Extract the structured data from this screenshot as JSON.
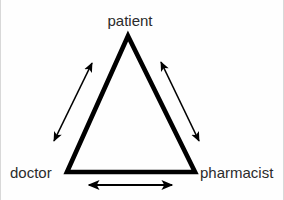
{
  "diagram": {
    "type": "triangle-relationship",
    "title": "",
    "background_color": "#fefefe",
    "stroke_color": "#000000",
    "label_color": "#2b2b2b",
    "nodes": [
      {
        "id": "patient",
        "label": "patient",
        "position": "apex",
        "x": 128,
        "y": 36
      },
      {
        "id": "doctor",
        "label": "doctor",
        "position": "bottom-left",
        "x": 67,
        "y": 172
      },
      {
        "id": "pharmacist",
        "label": "pharmacist",
        "position": "bottom-right",
        "x": 195,
        "y": 172
      }
    ],
    "edges": [
      {
        "id": "doctor-patient",
        "from": "doctor",
        "to": "patient",
        "bidirectional": true,
        "side": "left"
      },
      {
        "id": "patient-pharmacist",
        "from": "patient",
        "to": "pharmacist",
        "bidirectional": true,
        "side": "right"
      },
      {
        "id": "doctor-pharmacist",
        "from": "doctor",
        "to": "pharmacist",
        "bidirectional": true,
        "side": "bottom"
      }
    ],
    "triangle": {
      "apex": [
        128,
        36
      ],
      "bottom_left": [
        67,
        172
      ],
      "bottom_right": [
        195,
        172
      ],
      "stroke_width": 4.5
    },
    "arrows": [
      {
        "id": "arrow-left",
        "start": [
          53,
          143
        ],
        "end": [
          93,
          61
        ],
        "heads": "both",
        "stroke_width": 1.6
      },
      {
        "id": "arrow-right",
        "start": [
          160,
          60
        ],
        "end": [
          200,
          143
        ],
        "heads": "both",
        "stroke_width": 1.6
      },
      {
        "id": "arrow-bottom",
        "start": [
          88,
          185
        ],
        "end": [
          173,
          185
        ],
        "heads": "both",
        "stroke_width": 2.2
      }
    ]
  }
}
